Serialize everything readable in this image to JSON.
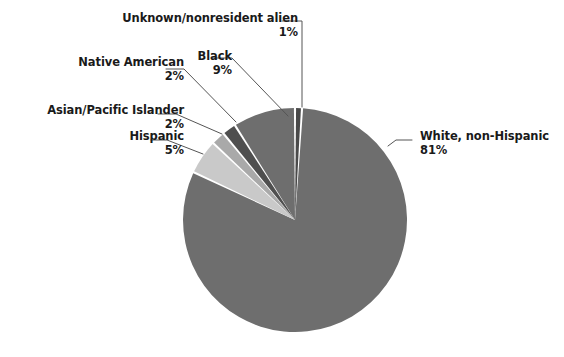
{
  "chart_data": {
    "type": "pie",
    "title": "",
    "subtitle": "",
    "xlabel": "",
    "ylabel": "",
    "grid": false,
    "legend_position": "none",
    "label_format": "name + percent outside with leader lines",
    "start_angle_deg": 0,
    "direction": "clockwise",
    "categories": [
      "Unknown/nonresident alien",
      "White, non-Hispanic",
      "Hispanic",
      "Asian/Pacific Islander",
      "Native American",
      "Black"
    ],
    "values": [
      1,
      81,
      5,
      2,
      2,
      9
    ],
    "value_labels": [
      "1%",
      "81%",
      "5%",
      "2%",
      "2%",
      "9%"
    ],
    "colors": [
      "#4a4a4a",
      "#6e6e6e",
      "#c9c9c9",
      "#a9a9a9",
      "#4f4f4f",
      "#6e6e6e"
    ],
    "slices": [
      {
        "name": "Unknown/nonresident alien",
        "value": 1,
        "value_label": "1%",
        "color": "#4a4a4a",
        "start_deg": 0,
        "end_deg": 3.6
      },
      {
        "name": "White, non-Hispanic",
        "value": 81,
        "value_label": "81%",
        "color": "#6e6e6e",
        "start_deg": 3.6,
        "end_deg": 295.2
      },
      {
        "name": "Hispanic",
        "value": 5,
        "value_label": "5%",
        "color": "#c9c9c9",
        "start_deg": 295.2,
        "end_deg": 313.2
      },
      {
        "name": "Asian/Pacific Islander",
        "value": 2,
        "value_label": "2%",
        "color": "#a9a9a9",
        "start_deg": 313.2,
        "end_deg": 320.4
      },
      {
        "name": "Native American",
        "value": 2,
        "value_label": "2%",
        "color": "#4f4f4f",
        "start_deg": 320.4,
        "end_deg": 327.6
      },
      {
        "name": "Black",
        "value": 9,
        "value_label": "9%",
        "color": "#6e6e6e",
        "start_deg": 327.6,
        "end_deg": 360
      }
    ],
    "total": 100,
    "units": "percent"
  },
  "labels": {
    "unknown": {
      "name": "Unknown/nonresident alien",
      "value": "1%"
    },
    "black": {
      "name": "Black",
      "value": "9%"
    },
    "native": {
      "name": "Native American",
      "value": "2%"
    },
    "asian": {
      "name": "Asian/Pacific Islander",
      "value": "2%"
    },
    "hispanic": {
      "name": "Hispanic",
      "value": "5%"
    },
    "white": {
      "name": "White, non-Hispanic",
      "value": "81%"
    }
  },
  "style": {
    "background": "#ffffff",
    "text_color": "#1a1a1a",
    "leader_line_color": "#555555",
    "slice_separator_color": "#ffffff"
  }
}
